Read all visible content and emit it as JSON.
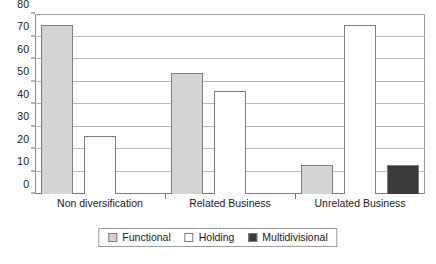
{
  "chart_data": {
    "type": "bar",
    "title": "",
    "subtitle": "",
    "xlabel": "",
    "ylabel": "",
    "ylim": [
      0,
      80
    ],
    "ytick_step": 10,
    "yticks": [
      0,
      10,
      20,
      30,
      40,
      50,
      60,
      70,
      80
    ],
    "grid": true,
    "grid_axis": "y",
    "legend_position": "bottom-center",
    "categories": [
      "Non diversification",
      "Related Business",
      "Unrelated Business"
    ],
    "series": [
      {
        "name": "Functional",
        "values": [
          75,
          54,
          13
        ],
        "color": "#d4d4d4"
      },
      {
        "name": "Holding",
        "values": [
          26,
          46,
          75
        ],
        "color": "#ffffff"
      },
      {
        "name": "Multidivisional",
        "values": [
          0,
          0,
          13
        ],
        "color": "#3a3a3a"
      }
    ]
  },
  "legend": {
    "items": [
      {
        "label": "Functional",
        "color": "#d4d4d4"
      },
      {
        "label": "Holding",
        "color": "#ffffff"
      },
      {
        "label": "Multidivisional",
        "color": "#3a3a3a"
      }
    ]
  },
  "colors": {
    "functional": "#d4d4d4",
    "holding": "#ffffff",
    "multidivisional": "#3a3a3a",
    "bar_border": "#7d7d7d",
    "gridline": "#b9b9b9",
    "axis": "#8c8c8c",
    "text": "#1a1a1a",
    "background": "#ffffff"
  }
}
